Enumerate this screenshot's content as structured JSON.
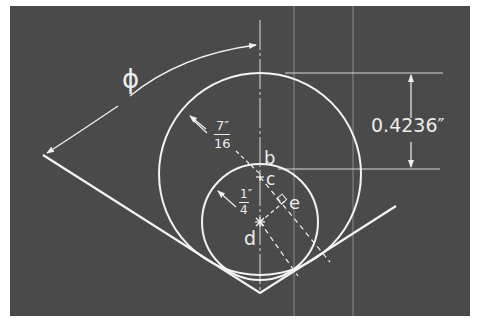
{
  "figure": {
    "background_color": "#4a4a4a",
    "line_color": "#f0f0f0",
    "labels": {
      "angle": "ϕ",
      "large_radius_num": "7″",
      "large_radius_den": "16",
      "small_radius_num": "1″",
      "small_radius_den": "4",
      "dimension": "0.4236″",
      "point_b": "b",
      "point_c": "c",
      "point_d": "d",
      "point_e": "e"
    },
    "elements": {
      "large_circle_radius": "7/16 in",
      "small_circle_radius": "1/4 in",
      "vertical_offset": "0.4236 in",
      "angle_symbol": "phi"
    }
  }
}
